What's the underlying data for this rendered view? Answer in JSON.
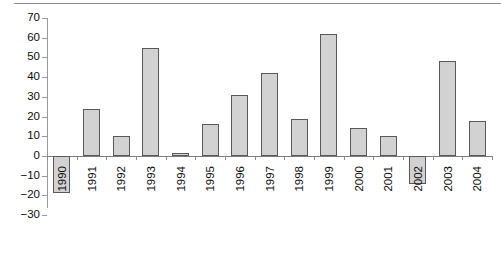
{
  "figure": {
    "top_rule": true,
    "background_color": "#ffffff"
  },
  "chart_data": {
    "type": "bar",
    "title": "",
    "subtitle": "",
    "xlabel": "",
    "ylabel": "",
    "categories": [
      "1990",
      "1991",
      "1992",
      "1993",
      "1994",
      "1995",
      "1996",
      "1997",
      "1998",
      "1999",
      "2000",
      "2001",
      "2002",
      "2003",
      "2004"
    ],
    "values": [
      -19,
      24,
      10,
      55,
      1.5,
      16,
      31,
      42,
      19,
      62,
      14,
      10,
      -14,
      48,
      18
    ],
    "series": [
      {
        "name": "",
        "values": [
          -19,
          24,
          10,
          55,
          1.5,
          16,
          31,
          42,
          19,
          62,
          14,
          10,
          -14,
          48,
          18
        ]
      }
    ],
    "ylim": [
      -30,
      70
    ],
    "yticks": [
      70,
      60,
      50,
      40,
      30,
      20,
      10,
      0,
      -10,
      -20,
      -30
    ],
    "ytick_labels": [
      "70",
      "60",
      "50",
      "40",
      "30",
      "20",
      "10",
      "0",
      "−10",
      "−20",
      "−30"
    ],
    "grid": false,
    "legend": null,
    "legend_position": "none",
    "bar_fill_color": "#d2d2d2",
    "bar_edge_color": "#58595b",
    "axis_color": "#8a8a8a",
    "xtick_label_rotation": 90
  }
}
